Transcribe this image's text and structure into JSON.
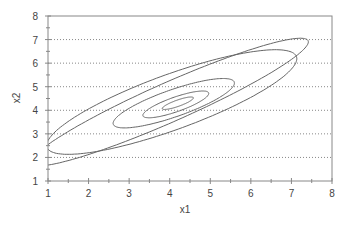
{
  "chart_data": {
    "type": "line",
    "subtype": "contour",
    "title": "",
    "xlabel": "x1",
    "ylabel": "x2",
    "xlim": [
      1,
      8
    ],
    "ylim": [
      1,
      8
    ],
    "xticks": [
      "1",
      "2",
      "3",
      "4",
      "5",
      "6",
      "7",
      "8"
    ],
    "yticks": [
      "1",
      "2",
      "3",
      "4",
      "5",
      "6",
      "7",
      "8"
    ],
    "grid": {
      "horizontal": true,
      "vertical": false,
      "style": "dotted"
    },
    "legend": null,
    "center": [
      4.2,
      4.3
    ],
    "series": [
      {
        "name": "contour-1",
        "cx": 4.2,
        "cy": 4.3,
        "rx": 0.45,
        "ry": 0.12,
        "angle_deg": 33
      },
      {
        "name": "contour-2",
        "cx": 4.15,
        "cy": 4.25,
        "rx": 0.95,
        "ry": 0.28,
        "angle_deg": 33
      },
      {
        "name": "contour-3",
        "cx": 4.1,
        "cy": 4.3,
        "rx": 1.75,
        "ry": 0.52,
        "angle_deg": 33
      },
      {
        "name": "contour-4",
        "cx": 4.05,
        "cy": 4.35,
        "rx": 3.65,
        "ry": 1.05,
        "angle_deg": 34
      },
      {
        "name": "contour-5",
        "cx": 4.0,
        "cy": 4.35,
        "rx": 4.3,
        "ry": 0.72,
        "angle_deg": 38
      }
    ],
    "colors": {
      "line": "#666666",
      "grid": "#888888",
      "frame": "#888888"
    }
  }
}
